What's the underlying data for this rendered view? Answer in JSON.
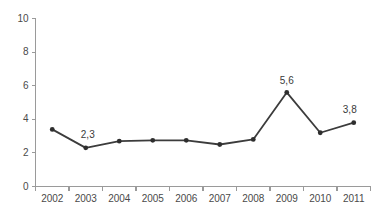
{
  "chart_data": {
    "type": "line",
    "title": "",
    "subtitle": "",
    "xlabel": "",
    "ylabel": "",
    "categories": [
      "2002",
      "2003",
      "2004",
      "2005",
      "2006",
      "2007",
      "2008",
      "2009",
      "2010",
      "2011"
    ],
    "values": [
      3.4,
      2.3,
      2.7,
      2.75,
      2.75,
      2.5,
      2.8,
      5.6,
      3.2,
      3.8
    ],
    "point_labels": [
      null,
      "2,3",
      null,
      null,
      null,
      null,
      null,
      "5,6",
      null,
      "3,8"
    ],
    "ylim": [
      0,
      10
    ],
    "yticks": [
      0,
      2,
      4,
      6,
      8,
      10
    ],
    "ytick_labels": [
      "0",
      "2",
      "4",
      "6",
      "8",
      "10"
    ],
    "grid": false,
    "legend": null,
    "legend_position": "none",
    "decimal_separator": ",",
    "series": [
      {
        "name": "",
        "values": [
          3.4,
          2.3,
          2.7,
          2.75,
          2.75,
          2.5,
          2.8,
          5.6,
          3.2,
          3.8
        ]
      }
    ],
    "colors": {
      "line": "#3c3c3c",
      "marker": "#2e2e2e",
      "axis": "#9a9a9a",
      "tick_label": "#4a4a4a",
      "point_label": "#3a3a3a",
      "background": "#ffffff"
    }
  }
}
